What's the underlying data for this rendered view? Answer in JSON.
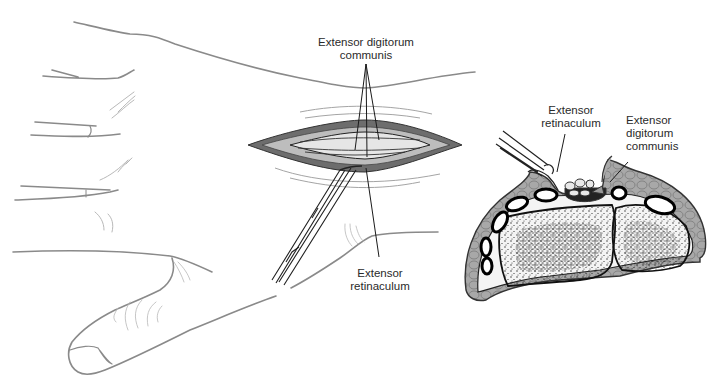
{
  "figure": {
    "type": "anatomical-surgical-illustration",
    "panels": [
      {
        "id": "dorsal-wrist-incision",
        "description": "Dorsal view of hand and wrist with longitudinal incision, retractor in place",
        "labels": [
          {
            "id": "edc-top",
            "lines": [
              "Extensor digitorum",
              "communis"
            ]
          },
          {
            "id": "retinaculum-bottom",
            "lines": [
              "Extensor",
              "retinaculum"
            ]
          }
        ]
      },
      {
        "id": "wrist-cross-section",
        "description": "Cross-section of distal radius/ulna at wrist showing extensor compartments",
        "labels": [
          {
            "id": "retinaculum-xs",
            "lines": [
              "Extensor",
              "retinaculum"
            ]
          },
          {
            "id": "edc-xs",
            "lines": [
              "Extensor",
              "digitorum",
              "communis"
            ]
          }
        ]
      }
    ]
  },
  "colors": {
    "skin_line": "#8a8a8a",
    "leader_line": "#1a1a1a",
    "tissue_fill": "#9a9a9a",
    "bone_fill": "#f2f2f2",
    "text": "#2a2a2a"
  }
}
